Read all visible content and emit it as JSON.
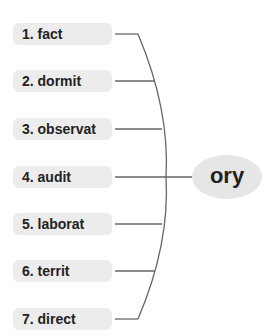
{
  "diagram": {
    "type": "word-formation-bracket",
    "stems": [
      {
        "label": "1. fact",
        "y": 34
      },
      {
        "label": "2. dormit",
        "y": 81
      },
      {
        "label": "3. observat",
        "y": 129
      },
      {
        "label": "4. audit",
        "y": 177
      },
      {
        "label": "5. laborat",
        "y": 224
      },
      {
        "label": "6. territ",
        "y": 271
      },
      {
        "label": "7. direct",
        "y": 319
      }
    ],
    "suffix": {
      "label": "ory"
    },
    "colors": {
      "box_fill": "#ececec",
      "suffix_fill": "#e6e6e6",
      "line": "#666666",
      "text": "#222222"
    }
  }
}
